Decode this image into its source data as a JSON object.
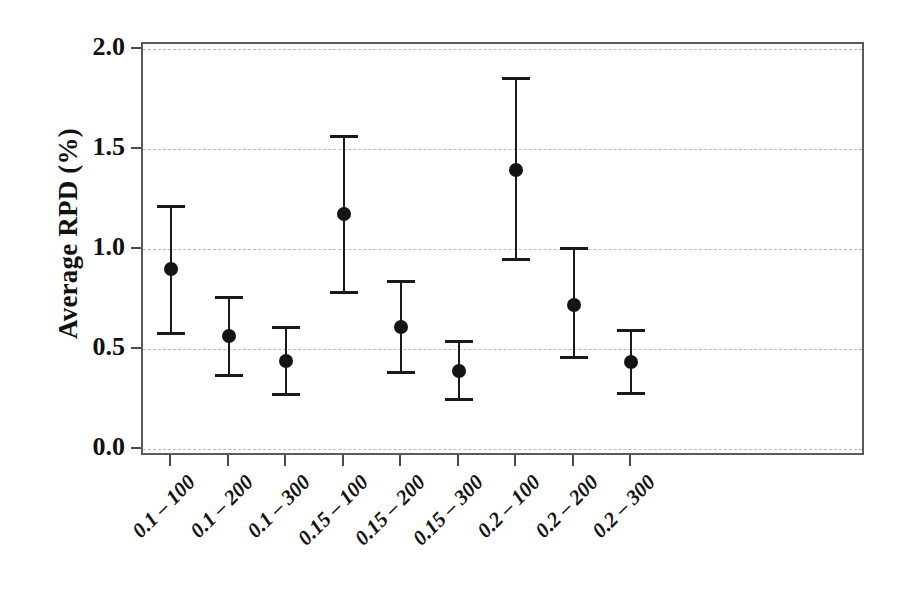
{
  "chart_data": {
    "type": "scatter",
    "title": "",
    "xlabel": "",
    "ylabel": "Average RPD (%)",
    "ylim": [
      0.0,
      2.0
    ],
    "yticks": [
      "0.0",
      "0.5",
      "1.0",
      "1.5",
      "2.0"
    ],
    "ytick_values": [
      0.0,
      0.5,
      1.0,
      1.5,
      2.0
    ],
    "grid": true,
    "legend": "none",
    "error_bars": "vertical with caps",
    "marker": "filled-circle",
    "marker_color": "#141414",
    "line_color": "#1a1a1a",
    "grid_color": "#b9b9b9",
    "frame_color": "#5a5a5a",
    "categories": [
      "0.1 – 100",
      "0.1 – 200",
      "0.1 – 300",
      "0.15 – 100",
      "0.15 – 200",
      "0.15 – 300",
      "0.2 – 100",
      "0.2 – 200",
      "0.2 – 300"
    ],
    "values": [
      0.9,
      0.565,
      0.44,
      1.175,
      0.61,
      0.39,
      1.395,
      0.72,
      0.435
    ],
    "err_low": [
      0.57,
      0.36,
      0.265,
      0.775,
      0.375,
      0.24,
      0.94,
      0.45,
      0.27
    ],
    "err_high": [
      1.22,
      0.765,
      0.615,
      1.57,
      0.845,
      0.545,
      1.86,
      1.01,
      0.6
    ],
    "points": [
      {
        "category": "0.1 – 100",
        "value": 0.9,
        "low": 0.57,
        "high": 1.22
      },
      {
        "category": "0.1 – 200",
        "value": 0.565,
        "low": 0.36,
        "high": 0.765
      },
      {
        "category": "0.1 – 300",
        "value": 0.44,
        "low": 0.265,
        "high": 0.615
      },
      {
        "category": "0.15 – 100",
        "value": 1.175,
        "low": 0.775,
        "high": 1.57
      },
      {
        "category": "0.15 – 200",
        "value": 0.61,
        "low": 0.375,
        "high": 0.845
      },
      {
        "category": "0.15 – 300",
        "value": 0.39,
        "low": 0.24,
        "high": 0.545
      },
      {
        "category": "0.2 – 100",
        "value": 1.395,
        "low": 0.94,
        "high": 1.86
      },
      {
        "category": "0.2 – 200",
        "value": 0.72,
        "low": 0.45,
        "high": 1.01
      },
      {
        "category": "0.2 – 300",
        "value": 0.435,
        "low": 0.27,
        "high": 0.6
      }
    ]
  }
}
